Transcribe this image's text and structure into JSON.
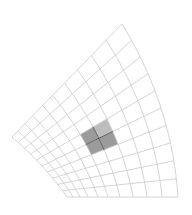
{
  "figure": {
    "type": "curvilinear-mesh",
    "width": 192,
    "height": 215,
    "background": "#ffffff",
    "grid_color": "#cfcfcf",
    "grid": {
      "radial_cells": 10,
      "angular_cells": 10,
      "radial_spacing": [
        0,
        0.054,
        0.117,
        0.189,
        0.279,
        0.369,
        0.477,
        0.595,
        0.721,
        0.856,
        1.0
      ]
    },
    "boundary": {
      "inner_arc": {
        "start": [
          67,
          197
        ],
        "mid": [
          42,
          166
        ],
        "end": [
          12,
          137
        ]
      },
      "outer_arc": {
        "start": [
          178,
          197
        ],
        "mid": [
          161,
          108
        ],
        "end": [
          122,
          24
        ]
      },
      "bottom_edge": {
        "start": [
          67,
          197
        ],
        "end": [
          178,
          197
        ]
      },
      "top_edge": {
        "start": [
          12,
          137
        ],
        "end": [
          122,
          24
        ]
      }
    },
    "highlight": {
      "fill_dark": "#9b9b9b",
      "fill_light": "#bdbdbd",
      "line_color": "#3a3a3a",
      "cells": [
        {
          "i": 5,
          "j": 4,
          "shade": "dark"
        },
        {
          "i": 6,
          "j": 4,
          "shade": "dark"
        },
        {
          "i": 5,
          "j": 5,
          "shade": "dark"
        },
        {
          "i": 6,
          "j": 5,
          "shade": "light"
        }
      ],
      "cross_node": {
        "i": 6,
        "j": 5
      }
    }
  }
}
